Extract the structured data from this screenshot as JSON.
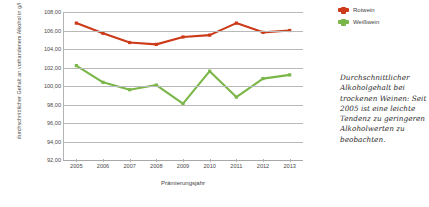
{
  "chart_data": {
    "type": "line",
    "title": "",
    "xlabel": "Prämierungsjahr",
    "ylabel": "durchschnittlicher Gehalt an vorhandenem Alkohol in g/l",
    "categories": [
      "2005",
      "2006",
      "2007",
      "2008",
      "2009",
      "2010",
      "2011",
      "2012",
      "2013"
    ],
    "ylim": [
      92.0,
      108.0
    ],
    "ytick_labels": [
      "108,00",
      "106,00",
      "104,00",
      "102,00",
      "100,00",
      "98,00",
      "96,00",
      "94,00",
      "92,00"
    ],
    "ytick_values": [
      108.0,
      106.0,
      104.0,
      102.0,
      100.0,
      98.0,
      96.0,
      94.0,
      92.0
    ],
    "grid": true,
    "legend_position": "top-right",
    "series": [
      {
        "name": "Rotwein",
        "color": "#CC3A19",
        "values": [
          106.8,
          105.7,
          104.7,
          104.5,
          105.3,
          105.5,
          106.8,
          105.8,
          106.0
        ]
      },
      {
        "name": "Weißwein",
        "color": "#7AB648",
        "values": [
          102.2,
          100.4,
          99.6,
          100.1,
          98.1,
          101.6,
          98.8,
          100.8,
          101.2
        ]
      }
    ]
  },
  "legend": {
    "items": [
      {
        "label": "Rotwein",
        "color": "#CC3A19"
      },
      {
        "label": "Weißwein",
        "color": "#7AB648"
      }
    ]
  },
  "caption": {
    "text": "Durchschnittlicher Alkoholgehalt bei trockenen Weinen: Seit 2005 ist eine leichte Tendenz zu geringeren Alkoholwerten zu beobachten."
  }
}
